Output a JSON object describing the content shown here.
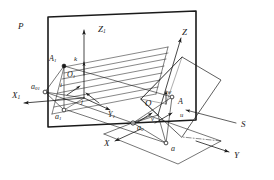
{
  "figure": {
    "type": "geometric-projection-diagram",
    "background": "#ffffff",
    "ink_color": "#1a1a1a",
    "width": 274,
    "height": 180
  },
  "labels": {
    "plane_p": {
      "text": "P",
      "x": 18,
      "y": 23
    },
    "axis_z1": {
      "text": "Z",
      "sub": "1",
      "x": 98,
      "y": 26
    },
    "axis_x1": {
      "text": "X",
      "sub": "1",
      "x": 13,
      "y": 92
    },
    "axis_y1": {
      "text": "Y",
      "sub": "1",
      "x": 108,
      "y": 112
    },
    "origin_o1": {
      "text": "O",
      "sub": "1",
      "x": 68,
      "y": 72
    },
    "point_a1_upper": {
      "text": "A",
      "sub": "1",
      "x": 49,
      "y": 56
    },
    "point_a1_lower": {
      "text": "a",
      "sub": "1",
      "x": 55,
      "y": 114
    },
    "point_a01": {
      "text": "a",
      "sub": "01",
      "x": 33,
      "y": 85
    },
    "vector_i": {
      "text": "i",
      "x": 60,
      "y": 83
    },
    "vector_j": {
      "text": "j",
      "x": 81,
      "y": 100
    },
    "vector_k": {
      "text": "k",
      "x": 74,
      "y": 57
    },
    "axis_z": {
      "text": "Z",
      "x": 182,
      "y": 29
    },
    "axis_x": {
      "text": "X",
      "x": 105,
      "y": 140
    },
    "axis_y": {
      "text": "Y",
      "x": 234,
      "y": 152
    },
    "origin_o": {
      "text": "O",
      "x": 146,
      "y": 100
    },
    "point_a_upper": {
      "text": "A",
      "x": 178,
      "y": 99
    },
    "point_a_lower": {
      "text": "a",
      "x": 170,
      "y": 146
    },
    "point_a0": {
      "text": "a",
      "sub": "0",
      "x": 138,
      "y": 125
    },
    "vector_w": {
      "text": "w",
      "x": 167,
      "y": 91
    },
    "vector_u": {
      "text": "u",
      "x": 180,
      "y": 114
    },
    "vector_v": {
      "text": "v",
      "x": 152,
      "y": 117
    },
    "surface_s": {
      "text": "S",
      "x": 240,
      "y": 121
    }
  },
  "geometry": {
    "plane_p_outline": "48,18 196,12 196,120 48,126",
    "surface_s_outline": "141,98 182,57 220,79 182,136",
    "ground_plane_outline": "104,133 150,116 221,140 178,163",
    "axis_z1_line": "84,98 84,28",
    "axis_x1_line": "66,88 22,102",
    "axis_y1_line": "84,98 112,109",
    "axis_z_line": "160,110 180,36",
    "axis_x_line": "141,130 113,142",
    "axis_y_line": "197,142 230,152",
    "leader_s": "236,122 184,110"
  }
}
